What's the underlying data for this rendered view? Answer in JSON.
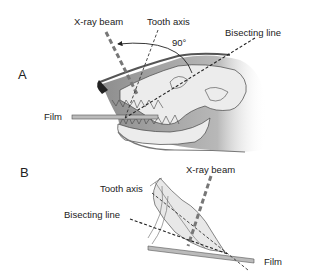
{
  "panels": {
    "a": {
      "letter": "A",
      "labels": {
        "xray_beam": "X-ray beam",
        "tooth_axis": "Tooth axis",
        "bisecting_line": "Bisecting line",
        "angle": "90°",
        "film": "Film"
      }
    },
    "b": {
      "letter": "B",
      "labels": {
        "xray_beam": "X-ray beam",
        "tooth_axis": "Tooth axis",
        "bisecting_line": "Bisecting line",
        "film": "Film"
      }
    }
  },
  "colors": {
    "line": "#222222",
    "beam": "#777777",
    "skull_fill": "#e4e4e4",
    "skin_fill": "#b5b5b5",
    "film": "#999999"
  }
}
